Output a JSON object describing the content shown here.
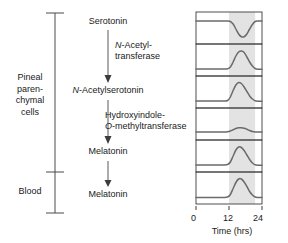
{
  "diagram": {
    "bracket": {
      "compartment_upper": "Pineal\nparen-\nchymal\ncells",
      "compartment_upper_lines": [
        "Pineal",
        "paren-",
        "chymal",
        "cells"
      ],
      "compartment_lower": "Blood"
    },
    "pathway": {
      "nodes": [
        {
          "id": "serotonin",
          "label": "Serotonin",
          "italic_prefix": ""
        },
        {
          "id": "n-acetylserotonin",
          "label": "N-Acetylserotonin",
          "italic_prefix": "N"
        },
        {
          "id": "melatonin-pineal",
          "label": "Melatonin",
          "italic_prefix": ""
        },
        {
          "id": "melatonin-blood",
          "label": "Melatonin",
          "italic_prefix": ""
        }
      ],
      "enzymes": [
        {
          "id": "nat",
          "line1": "N-Acetyl-",
          "line2": "transferase",
          "italic_prefix": "N"
        },
        {
          "id": "hiomt",
          "line1": "Hydroxyindole-",
          "line2": "O-methyltransferase",
          "italic_prefix": "O"
        }
      ]
    }
  },
  "chart_data": {
    "type": "line",
    "title": "",
    "subtitle": "",
    "xlabel": "Time (hrs)",
    "ylabel": "",
    "xlim": [
      0,
      24
    ],
    "ylim": [
      0,
      1
    ],
    "xticks": [
      0,
      12,
      24
    ],
    "xtick_labels": [
      "0",
      "12",
      "24"
    ],
    "grid": false,
    "legend": "none",
    "shaded_region": {
      "label": "dark period",
      "x_start": 12,
      "x_end": 21.5,
      "color": "#e3e3e3"
    },
    "panel_count": 6,
    "line_color": "#6b6b6b",
    "panels": [
      {
        "index": 1,
        "name": "serotonin",
        "shape": "trough",
        "x": [
          0,
          2,
          4,
          6,
          8,
          10,
          11.5,
          12.5,
          13.5,
          14.5,
          15.5,
          16.5,
          17.5,
          18.5,
          19.5,
          20.5,
          21.5,
          22.5,
          24
        ],
        "y": [
          0.78,
          0.78,
          0.78,
          0.78,
          0.78,
          0.78,
          0.78,
          0.76,
          0.66,
          0.46,
          0.26,
          0.15,
          0.15,
          0.26,
          0.46,
          0.64,
          0.76,
          0.78,
          0.78
        ]
      },
      {
        "index": 2,
        "name": "n-acetyltransferase-activity",
        "shape": "peak",
        "x": [
          0,
          2,
          4,
          6,
          8,
          10,
          11.5,
          12.5,
          13.5,
          14.5,
          15.5,
          16.5,
          17.5,
          18.5,
          19.5,
          20.5,
          21.5,
          22.5,
          24
        ],
        "y": [
          0.14,
          0.14,
          0.14,
          0.14,
          0.14,
          0.14,
          0.15,
          0.22,
          0.42,
          0.66,
          0.82,
          0.86,
          0.8,
          0.62,
          0.42,
          0.26,
          0.16,
          0.13,
          0.13
        ]
      },
      {
        "index": 3,
        "name": "n-acetylserotonin",
        "shape": "peak",
        "x": [
          0,
          2,
          4,
          6,
          8,
          10,
          11.5,
          12.5,
          13.5,
          14.5,
          15.5,
          16.5,
          17.5,
          18.5,
          19.5,
          20.5,
          21.5,
          22.5,
          24
        ],
        "y": [
          0.14,
          0.14,
          0.14,
          0.14,
          0.14,
          0.14,
          0.16,
          0.3,
          0.56,
          0.78,
          0.88,
          0.84,
          0.7,
          0.52,
          0.34,
          0.22,
          0.15,
          0.13,
          0.13
        ]
      },
      {
        "index": 4,
        "name": "hydroxyindole-o-methyltransferase-activity",
        "shape": "small-bump",
        "x": [
          0,
          2,
          4,
          6,
          8,
          10,
          11.5,
          12.5,
          13.5,
          14.5,
          15.5,
          16.5,
          17.5,
          18.5,
          19.5,
          20.5,
          21.5,
          22.5,
          24
        ],
        "y": [
          0.18,
          0.18,
          0.18,
          0.18,
          0.18,
          0.18,
          0.19,
          0.22,
          0.27,
          0.32,
          0.35,
          0.35,
          0.33,
          0.29,
          0.24,
          0.2,
          0.18,
          0.18,
          0.18
        ]
      },
      {
        "index": 5,
        "name": "melatonin-pineal",
        "shape": "peak",
        "x": [
          0,
          2,
          4,
          6,
          8,
          10,
          11.5,
          12.5,
          13.5,
          14.5,
          15.5,
          16.5,
          17.5,
          18.5,
          19.5,
          20.5,
          21.5,
          22.5,
          24
        ],
        "y": [
          0.14,
          0.14,
          0.14,
          0.14,
          0.14,
          0.14,
          0.16,
          0.26,
          0.5,
          0.74,
          0.86,
          0.84,
          0.72,
          0.54,
          0.36,
          0.22,
          0.15,
          0.13,
          0.13
        ]
      },
      {
        "index": 6,
        "name": "melatonin-blood",
        "shape": "peak",
        "x": [
          0,
          2,
          4,
          6,
          8,
          10,
          11.5,
          12.5,
          13.5,
          14.5,
          15.5,
          16.5,
          17.5,
          18.5,
          19.5,
          20.5,
          21.5,
          22.5,
          24
        ],
        "y": [
          0.12,
          0.12,
          0.12,
          0.12,
          0.12,
          0.12,
          0.14,
          0.24,
          0.48,
          0.72,
          0.86,
          0.86,
          0.74,
          0.56,
          0.36,
          0.22,
          0.14,
          0.12,
          0.12
        ]
      }
    ]
  },
  "colors": {
    "line": "#6b6b6b",
    "shade": "#e3e3e3",
    "frame": "#3c3c3c",
    "text": "#1a1a1a"
  }
}
